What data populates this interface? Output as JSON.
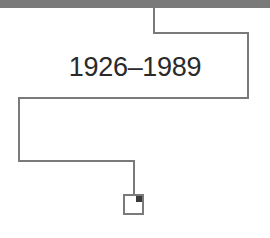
{
  "diagram": {
    "label": "1926–1989",
    "colors": {
      "line": "#7a7a7a",
      "topbar": "#7a7a7a",
      "text": "#2a2a2a",
      "corner": "#3a3a3a"
    },
    "node": {
      "shape": "square",
      "marker": "filled-top-right-corner"
    }
  }
}
